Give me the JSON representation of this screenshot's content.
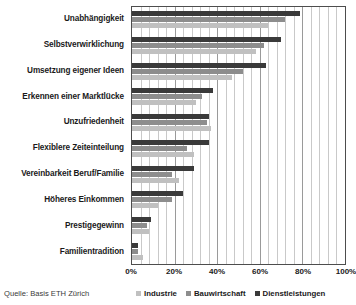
{
  "chart_data": {
    "type": "bar",
    "orientation": "horizontal",
    "title": "",
    "xlabel": "",
    "ylabel": "",
    "xlim": [
      0,
      100
    ],
    "xticks": [
      0,
      20,
      40,
      60,
      80,
      100
    ],
    "xtick_labels": [
      "0%",
      "20%",
      "40%",
      "60%",
      "80%",
      "100%"
    ],
    "grid": true,
    "minor_grid_step": 4,
    "legend_position": "bottom",
    "categories": [
      "Unabhängigkeit",
      "Selbstverwirklichung",
      "Umsetzung eigener Ideen",
      "Erkennen einer Marktlücke",
      "Unzufriedenheit",
      "Flexiblere Zeiteinteilung",
      "Vereinbarkeit Beruf/Familie",
      "Höheres Einkommen",
      "Prestigegewinn",
      "Familientradition"
    ],
    "series": [
      {
        "name": "Industrie",
        "color": "#c0c0c0",
        "values": [
          64,
          58,
          47,
          30,
          37,
          29,
          22,
          12,
          8,
          5
        ]
      },
      {
        "name": "Bauwirtschaft",
        "color": "#8d8d8d",
        "values": [
          72,
          62,
          52,
          33,
          35,
          26,
          19,
          19,
          7,
          3
        ]
      },
      {
        "name": "Dienstleistungen",
        "color": "#3a3a3a",
        "values": [
          79,
          70,
          63,
          38,
          36,
          36,
          29,
          24,
          9,
          3
        ]
      }
    ],
    "source_note": "Quelle: Basis ETH Zürich"
  },
  "legend": {
    "items": [
      {
        "label": "Industrie",
        "key": "s-ind"
      },
      {
        "label": "Bauwirtschaft",
        "key": "s-bau"
      },
      {
        "label": "Dienstleistungen",
        "key": "s-dienst"
      }
    ]
  },
  "colors": {
    "industrie": "#c0c0c0",
    "bauwirtschaft": "#8d8d8d",
    "dienstleistungen": "#3a3a3a",
    "axis": "#4d4d4d",
    "gridline": "#c9c9c9",
    "background": "#ffffff"
  }
}
